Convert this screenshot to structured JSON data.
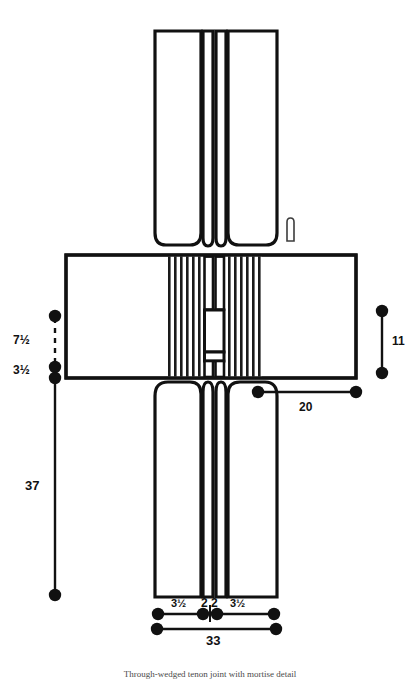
{
  "figure": {
    "caption": "Through-wedged tenon joint with mortise detail",
    "stroke_color": "#111111",
    "fill_color": "#ffffff",
    "hatch_color": "#1a1a1a"
  },
  "dimensions": {
    "left_upper": "7½",
    "left_mid": "3½",
    "left_long": "37",
    "right_vertical": "11",
    "rail_horizontal": "20",
    "bottom_left_stile": "3½",
    "bottom_tenon_a": "2",
    "bottom_tenon_b": "2",
    "bottom_right_stile": "3½",
    "bottom_overall": "33"
  },
  "parts": {
    "top_post": "top-post",
    "bottom_post": "bottom-post",
    "cross_rail": "cross-rail",
    "hatched_left": "hatched-end-grain-left",
    "hatched_right": "hatched-end-grain-right",
    "center_mortise": "center-mortise",
    "wedge_marker": "wedge-peg-marker"
  }
}
